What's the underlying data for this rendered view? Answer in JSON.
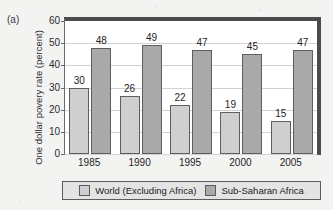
{
  "panel_letter": "(a)",
  "chart_data": {
    "type": "bar",
    "title": "",
    "xlabel": "",
    "ylabel": "One dollar povery rate (percent)",
    "categories": [
      "1985",
      "1990",
      "1995",
      "2000",
      "2005"
    ],
    "series": [
      {
        "name": "World (Excluding Africa)",
        "color": "#cfcfcf",
        "values": [
          30,
          26,
          22,
          19,
          15
        ]
      },
      {
        "name": "Sub-Saharan Africa",
        "color": "#a9a9a9",
        "values": [
          48,
          49,
          47,
          45,
          47
        ]
      }
    ],
    "ylim": [
      0,
      60
    ],
    "yticks": [
      0,
      10,
      20,
      30,
      40,
      50,
      60
    ],
    "ytick_labels": [
      "0",
      "10",
      "20",
      "30",
      "40",
      "50",
      "60"
    ],
    "grid": true,
    "legend_position": "bottom",
    "data_labels": true
  },
  "colors": {
    "world_bar": "#cfcfcf",
    "ssa_bar": "#a9a9a9",
    "frame": "#4b4b4b",
    "gridline": "#d2d2d2",
    "legend_background": "#e4e4e4",
    "page_background": "#f3f3f2"
  }
}
